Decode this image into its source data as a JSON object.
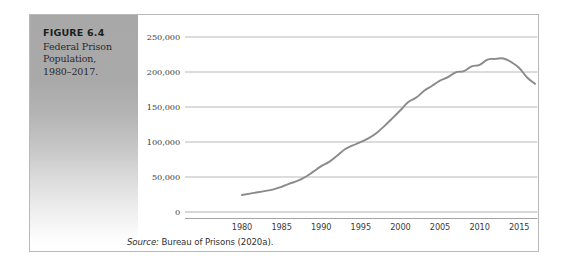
{
  "figure": {
    "caption_title": "FIGURE 6.4",
    "caption_lines": [
      "Federal Prison",
      "Population,",
      "1980–2017."
    ],
    "source_label": "Source:",
    "source_text": " Bureau of Prisons (2020a)."
  },
  "colors": {
    "line": "#8a8a8a",
    "gridline": "#b0b0b0",
    "axis": "#9a9a9a",
    "panel_top": "#a8a8a8",
    "panel_bottom": "#ffffff",
    "border": "#b9b9b9",
    "text": "#2f2f2f"
  },
  "chart_data": {
    "type": "line",
    "title": "Federal Prison Population, 1980–2017",
    "subtitle": "",
    "xlabel": "",
    "ylabel": "",
    "source": "Source: Bureau of Prisons (2020a).",
    "grid": "horizontal",
    "legend": "none",
    "xlim": [
      1980,
      2017
    ],
    "ylim": [
      0,
      250000
    ],
    "xticks": [
      1980,
      1985,
      1990,
      1995,
      2000,
      2005,
      2010,
      2015
    ],
    "xtick_labels": [
      "1980",
      "1985",
      "1990",
      "1995",
      "2000",
      "2005",
      "2010",
      "2015"
    ],
    "yticks": [
      0,
      50000,
      100000,
      150000,
      200000,
      250000
    ],
    "ytick_labels": [
      "0",
      "50,000",
      "100,000",
      "150,000",
      "200,000",
      "250,000"
    ],
    "x": [
      1980,
      1981,
      1982,
      1983,
      1984,
      1985,
      1986,
      1987,
      1988,
      1989,
      1990,
      1991,
      1992,
      1993,
      1994,
      1995,
      1996,
      1997,
      1998,
      1999,
      2000,
      2001,
      2002,
      2003,
      2004,
      2005,
      2006,
      2007,
      2008,
      2009,
      2010,
      2011,
      2012,
      2013,
      2014,
      2015,
      2016,
      2017
    ],
    "values": [
      24252,
      26195,
      28133,
      30214,
      32317,
      36042,
      40505,
      44408,
      49928,
      57662,
      65526,
      71608,
      80259,
      89587,
      95034,
      100250,
      105544,
      112973,
      123041,
      134000,
      145416,
      156993,
      163528,
      173059,
      180328,
      187618,
      192584,
      199618,
      201280,
      208118,
      210227,
      217768,
      218687,
      219298,
      214149,
      205723,
      192170,
      183058
    ],
    "series": [
      {
        "name": "Federal prison population",
        "values": [
          24252,
          26195,
          28133,
          30214,
          32317,
          36042,
          40505,
          44408,
          49928,
          57662,
          65526,
          71608,
          80259,
          89587,
          95034,
          100250,
          105544,
          112973,
          123041,
          134000,
          145416,
          156993,
          163528,
          173059,
          180328,
          187618,
          192584,
          199618,
          201280,
          208118,
          210227,
          217768,
          218687,
          219298,
          214149,
          205723,
          192170,
          183058
        ]
      }
    ],
    "annotations": {
      "peak_year": 2013,
      "peak_value": 219298,
      "start_value": 24252,
      "end_value": 183058
    }
  }
}
